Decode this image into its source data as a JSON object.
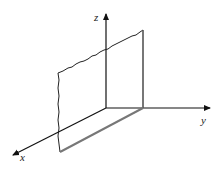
{
  "diagram": {
    "type": "3d-coordinate-axes-with-plane",
    "axes": {
      "x": {
        "label": "x"
      },
      "y": {
        "label": "y"
      },
      "z": {
        "label": "z"
      }
    },
    "colors": {
      "axis": "#111111",
      "plane_outline": "#222222",
      "plane_base": "#777777"
    }
  }
}
